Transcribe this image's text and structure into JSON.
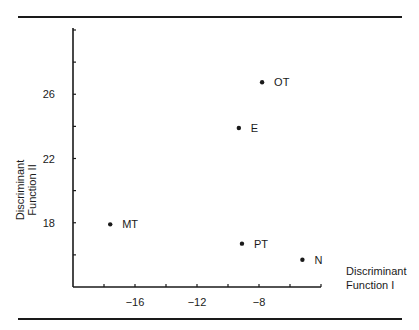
{
  "chart_data": {
    "type": "scatter",
    "title": "",
    "xlabel": "Discriminant Function I",
    "ylabel": "Discriminant Function II",
    "xlabel_lines": [
      "Discriminant",
      "Function I"
    ],
    "ylabel_lines": [
      "Discriminant",
      "Function II"
    ],
    "xlim": [
      -20,
      -4
    ],
    "ylim": [
      14,
      30
    ],
    "x_ticks": [
      -18,
      -16,
      -14,
      -12,
      -10,
      -8,
      -6
    ],
    "x_tick_labels": [
      "",
      "−16",
      "",
      "−12",
      "",
      "−8",
      ""
    ],
    "y_ticks": [
      16,
      18,
      20,
      22,
      24,
      26,
      28,
      30
    ],
    "y_tick_labels": [
      "",
      "18",
      "",
      "22",
      "",
      "26",
      "",
      ""
    ],
    "grid": false,
    "legend": null,
    "points": [
      {
        "label": "OT",
        "x": -7.8,
        "y": 26.75
      },
      {
        "label": "E",
        "x": -9.3,
        "y": 23.9
      },
      {
        "label": "MT",
        "x": -17.6,
        "y": 17.9
      },
      {
        "label": "PT",
        "x": -9.1,
        "y": 16.7
      },
      {
        "label": "N",
        "x": -5.2,
        "y": 15.7
      }
    ]
  }
}
